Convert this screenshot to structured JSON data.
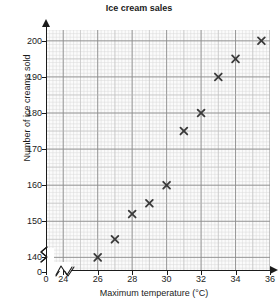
{
  "chart_data": {
    "type": "scatter",
    "title": "Ice cream sales",
    "xlabel": "Maximum temperature (°C)",
    "ylabel": "Number of ice creams sold",
    "xlim": [
      23,
      36
    ],
    "ylim": [
      136.5,
      203
    ],
    "grid": true,
    "legend": null,
    "axis_break_x": true,
    "axis_break_y": true,
    "x_ticks": [
      "0",
      "24",
      "26",
      "28",
      "30",
      "32",
      "34",
      "36"
    ],
    "x_tick_values": [
      23.1,
      24,
      26,
      28,
      30,
      32,
      34,
      36
    ],
    "y_ticks": [
      "0",
      "140",
      "150",
      "160",
      "170",
      "180",
      "190",
      "200"
    ],
    "y_tick_values": [
      137.2,
      140,
      150,
      160,
      170,
      180,
      190,
      200
    ],
    "x": [
      26,
      27,
      28,
      29,
      30,
      31,
      32,
      33,
      34,
      35.5
    ],
    "y": [
      140,
      145,
      152,
      155,
      160,
      175,
      180,
      190,
      195,
      200
    ],
    "points": [
      {
        "x": 26,
        "y": 140
      },
      {
        "x": 27,
        "y": 145
      },
      {
        "x": 28,
        "y": 152
      },
      {
        "x": 29,
        "y": 155
      },
      {
        "x": 30,
        "y": 160
      },
      {
        "x": 31,
        "y": 175
      },
      {
        "x": 32,
        "y": 180
      },
      {
        "x": 33,
        "y": 190
      },
      {
        "x": 34,
        "y": 195
      },
      {
        "x": 35.5,
        "y": 200
      }
    ],
    "marker": "x-cross",
    "marker_color": "#3a3a3a",
    "grid_major_color": "#8d8d8d",
    "grid_minor_color": "#d8d8d8",
    "axis_color": "#1b1b1b",
    "background": "#ffffff"
  }
}
